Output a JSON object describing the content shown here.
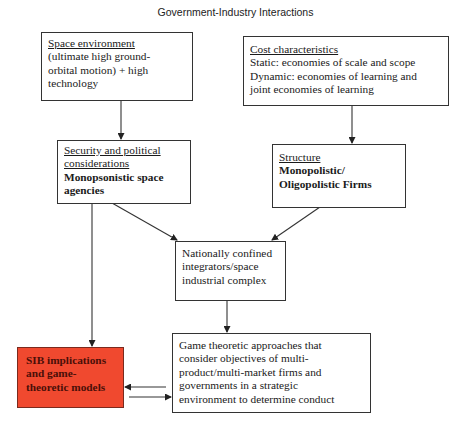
{
  "title": "Government-Industry Interactions",
  "boxes": {
    "space_environment": {
      "heading": "Space environment",
      "lines": [
        "(ultimate high ground-",
        "orbital motion) + high",
        "technology"
      ]
    },
    "cost_characteristics": {
      "heading": "Cost characteristics",
      "lines": [
        "Static: economies of scale and scope",
        "Dynamic: economies of learning and",
        "joint economies of learning"
      ]
    },
    "security": {
      "heading_lines": [
        "Security and political",
        "considerations"
      ],
      "bold_lines": [
        "Monopsonistic space",
        "agencies"
      ]
    },
    "structure": {
      "heading": "Structure",
      "bold_lines": [
        "Monopolistic/",
        "Oligopolistic Firms"
      ]
    },
    "integrators": {
      "lines": [
        "Nationally confined",
        "integrators/space",
        "industrial complex"
      ]
    },
    "game_theoretic": {
      "lines": [
        "Game theoretic approaches that",
        "consider objectives of multi-",
        "product/multi-market firms and",
        "governments in a strategic",
        "environment to determine conduct"
      ]
    },
    "sib": {
      "lines": [
        "SIB implications",
        "and game-",
        "theoretic models"
      ],
      "fill_color": "#f0492f"
    }
  },
  "colors": {
    "line": "#333333",
    "highlight": "#f0492f"
  }
}
